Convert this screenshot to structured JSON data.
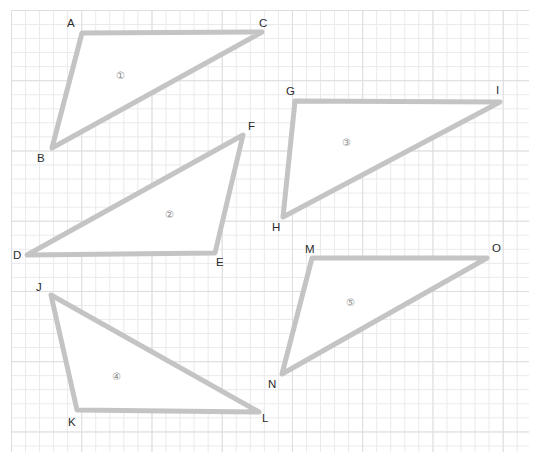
{
  "page": {
    "width": 539,
    "height": 461,
    "background_color": "#ffffff",
    "type": "geometry-worksheet-triangles-on-grid"
  },
  "grid": {
    "minor_color": "#e9e9ee",
    "major_color": "#dededf",
    "minor_cell_px": 14,
    "major_cell_px": 70,
    "left": 11,
    "top": 10,
    "width": 518,
    "height": 442
  },
  "style": {
    "stroke_color": "#c4c4c4",
    "stroke_width": 5,
    "fill_color": "#ffffff",
    "label_color": "#2b2b2b",
    "number_color": "#8a8a8a"
  },
  "shapes": [
    {
      "id": "triangle-1",
      "number_label": "①",
      "number_pos": {
        "x": 116,
        "y": 71
      },
      "points": "82,33 262,32 52,148",
      "vertices": [
        {
          "name": "A",
          "x": 82,
          "y": 33,
          "label_x": 67,
          "label_y": 18
        },
        {
          "name": "C",
          "x": 262,
          "y": 32,
          "label_x": 259,
          "label_y": 18
        },
        {
          "name": "B",
          "x": 52,
          "y": 148,
          "label_x": 37,
          "label_y": 153
        }
      ]
    },
    {
      "id": "triangle-2",
      "number_label": "②",
      "number_pos": {
        "x": 165,
        "y": 210
      },
      "points": "243,135 215,253 27,255",
      "vertices": [
        {
          "name": "F",
          "x": 243,
          "y": 135,
          "label_x": 248,
          "label_y": 121
        },
        {
          "name": "E",
          "x": 215,
          "y": 253,
          "label_x": 216,
          "label_y": 257
        },
        {
          "name": "D",
          "x": 27,
          "y": 255,
          "label_x": 13,
          "label_y": 250
        }
      ]
    },
    {
      "id": "triangle-3",
      "number_label": "③",
      "number_pos": {
        "x": 342,
        "y": 138
      },
      "points": "295,101 500,102 283,217",
      "vertices": [
        {
          "name": "G",
          "x": 295,
          "y": 101,
          "label_x": 286,
          "label_y": 86
        },
        {
          "name": "I",
          "x": 500,
          "y": 102,
          "label_x": 496,
          "label_y": 85
        },
        {
          "name": "H",
          "x": 283,
          "y": 217,
          "label_x": 272,
          "label_y": 222
        }
      ]
    },
    {
      "id": "triangle-4",
      "number_label": "④",
      "number_pos": {
        "x": 112,
        "y": 372
      },
      "points": "51,295 259,412 77,410",
      "vertices": [
        {
          "name": "J",
          "x": 51,
          "y": 295,
          "label_x": 36,
          "label_y": 282
        },
        {
          "name": "L",
          "x": 259,
          "y": 412,
          "label_x": 262,
          "label_y": 413
        },
        {
          "name": "K",
          "x": 77,
          "y": 410,
          "label_x": 68,
          "label_y": 417
        }
      ]
    },
    {
      "id": "triangle-5",
      "number_label": "⑤",
      "number_pos": {
        "x": 346,
        "y": 298
      },
      "points": "312,258 487,258 282,374",
      "vertices": [
        {
          "name": "M",
          "x": 312,
          "y": 258,
          "label_x": 305,
          "label_y": 244
        },
        {
          "name": "O",
          "x": 487,
          "y": 258,
          "label_x": 492,
          "label_y": 243
        },
        {
          "name": "N",
          "x": 282,
          "y": 374,
          "label_x": 268,
          "label_y": 379
        }
      ]
    }
  ]
}
